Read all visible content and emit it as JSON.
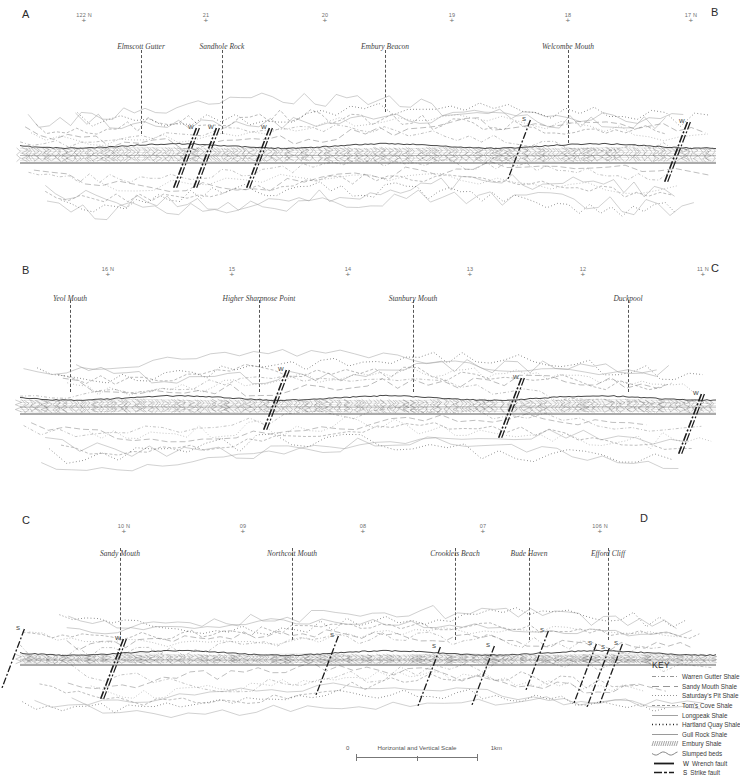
{
  "figure": {
    "scale": {
      "label": "Horizontal and Vertical Scale",
      "start": "0",
      "end": "1km"
    }
  },
  "panels": [
    {
      "id": "panel-a",
      "left_label": "A",
      "right_label": "B",
      "ticks": [
        {
          "label": "122 N",
          "x": 84
        },
        {
          "label": "21",
          "x": 206
        },
        {
          "label": "20",
          "x": 325
        },
        {
          "label": "19",
          "x": 452
        },
        {
          "label": "18",
          "x": 568
        },
        {
          "label": "17 N",
          "x": 691
        }
      ],
      "places": [
        {
          "label": "Elmscott Gutter",
          "x": 141,
          "leader_top": 50,
          "leader_height": 84
        },
        {
          "label": "Sandhole Rock",
          "x": 222,
          "leader_top": 50,
          "leader_height": 84
        },
        {
          "label": "Embury Beacon",
          "x": 385,
          "leader_top": 50,
          "leader_height": 62
        },
        {
          "label": "Welcombe Mouth",
          "x": 568,
          "leader_top": 50,
          "leader_height": 93
        }
      ],
      "faults": [
        {
          "type": "W",
          "x": 185,
          "y": 132
        },
        {
          "type": "W",
          "x": 205,
          "y": 132
        },
        {
          "type": "W",
          "x": 258,
          "y": 132
        },
        {
          "type": "S",
          "x": 519,
          "y": 124
        },
        {
          "type": "W",
          "x": 676,
          "y": 126
        }
      ]
    },
    {
      "id": "panel-b",
      "left_label": "B",
      "right_label": "C",
      "ticks": [
        {
          "label": "16 N",
          "x": 108
        },
        {
          "label": "15",
          "x": 232
        },
        {
          "label": "14",
          "x": 348
        },
        {
          "label": "13",
          "x": 470
        },
        {
          "label": "12",
          "x": 583
        },
        {
          "label": "11 N",
          "x": 703
        }
      ],
      "places": [
        {
          "label": "Yeol Mouth",
          "x": 70,
          "leader_top": 300,
          "leader_height": 92
        },
        {
          "label": "Higher Sharpnose Point",
          "x": 259,
          "leader_top": 300,
          "leader_height": 92
        },
        {
          "label": "Stanbury Mouth",
          "x": 413,
          "leader_top": 300,
          "leader_height": 92
        },
        {
          "label": "Duckpool",
          "x": 628,
          "leader_top": 300,
          "leader_height": 92
        }
      ],
      "faults": [
        {
          "type": "W",
          "x": 275,
          "y": 374
        },
        {
          "type": "W",
          "x": 510,
          "y": 382
        },
        {
          "type": "W",
          "x": 690,
          "y": 398
        }
      ]
    },
    {
      "id": "panel-c",
      "left_label": "C",
      "right_label": "D",
      "ticks": [
        {
          "label": "10 N",
          "x": 124
        },
        {
          "label": "09",
          "x": 243
        },
        {
          "label": "08",
          "x": 363
        },
        {
          "label": "07",
          "x": 483
        },
        {
          "label": "106 N",
          "x": 600
        }
      ],
      "places": [
        {
          "label": "Sandy Mouth",
          "x": 120,
          "leader_top": 548,
          "leader_height": 92
        },
        {
          "label": "Northcott Mouth",
          "x": 292,
          "leader_top": 548,
          "leader_height": 92
        },
        {
          "label": "Crooklets Beach",
          "x": 455,
          "leader_top": 548,
          "leader_height": 92
        },
        {
          "label": "Bude Haven",
          "x": 529,
          "leader_top": 548,
          "leader_height": 92
        },
        {
          "label": "Efford Cliff",
          "x": 608,
          "leader_top": 548,
          "leader_height": 92
        }
      ],
      "faults": [
        {
          "type": "S",
          "x": 13,
          "y": 633
        },
        {
          "type": "W",
          "x": 112,
          "y": 643
        },
        {
          "type": "S",
          "x": 327,
          "y": 640
        },
        {
          "type": "S",
          "x": 429,
          "y": 651
        },
        {
          "type": "S",
          "x": 483,
          "y": 650
        },
        {
          "type": "S",
          "x": 537,
          "y": 635
        },
        {
          "type": "S",
          "x": 585,
          "y": 648
        },
        {
          "type": "S",
          "x": 598,
          "y": 652
        },
        {
          "type": "S",
          "x": 611,
          "y": 648
        }
      ]
    }
  ],
  "key": {
    "title": "KEY",
    "items": [
      {
        "label": "Warren Gutter Shale",
        "style": "dash-dot-thin"
      },
      {
        "label": "Sandy Mouth Shale",
        "style": "long-dash"
      },
      {
        "label": "Saturday's Pit Shale",
        "style": "fine-dot"
      },
      {
        "label": "Tom's Cove Shale",
        "style": "short-dash"
      },
      {
        "label": "Longpeak Shale",
        "style": "solid-thin"
      },
      {
        "label": "Hartland Quay Shale",
        "style": "bold-dot"
      },
      {
        "label": "Gull Rock Shale",
        "style": "solid-grey"
      },
      {
        "label": "Embury Shale",
        "style": "hatched"
      },
      {
        "label": "Slumped beds",
        "style": "wavy"
      },
      {
        "label": "Wrench fault",
        "style": "fault-W",
        "letter": "W"
      },
      {
        "label": "Strike fault",
        "style": "fault-S",
        "letter": "S"
      }
    ]
  },
  "chart_data": {
    "type": "line",
    "xlabel": "Distance along coast (National Grid northings)",
    "ylabel": "Elevation (schematic)",
    "series": [
      {
        "name": "Warren Gutter Shale",
        "panel": "all"
      },
      {
        "name": "Sandy Mouth Shale",
        "panel": "all"
      },
      {
        "name": "Saturday's Pit Shale",
        "panel": "all"
      },
      {
        "name": "Tom's Cove Shale",
        "panel": "all"
      },
      {
        "name": "Longpeak Shale",
        "panel": "all"
      },
      {
        "name": "Hartland Quay Shale",
        "panel": "all"
      },
      {
        "name": "Gull Rock Shale",
        "panel": "all"
      },
      {
        "name": "Embury Shale",
        "panel": "all"
      },
      {
        "name": "Slumped beds",
        "panel": "all"
      }
    ],
    "grid": false,
    "legend": "bottom-right"
  }
}
